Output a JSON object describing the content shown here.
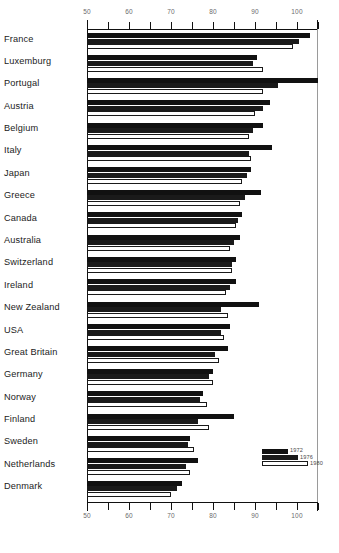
{
  "chart_data": {
    "type": "bar",
    "orientation": "horizontal",
    "title": "",
    "subtitle": "",
    "xlabel": "",
    "ylabel": "",
    "xlim": [
      50,
      105
    ],
    "grid": false,
    "axis_ticks_major": [
      50,
      60,
      70,
      80,
      90,
      100
    ],
    "axis_ticks_minor": [
      55,
      65,
      75,
      85,
      95,
      105
    ],
    "tick_labels": [
      "50",
      "60",
      "70",
      "80",
      "90",
      "100"
    ],
    "legend_position": "bottom-right",
    "categories": [
      "France",
      "Luxemburg",
      "Portugal",
      "Austria",
      "Belgium",
      "Italy",
      "Japan",
      "Greece",
      "Canada",
      "Australia",
      "Switzerland",
      "Ireland",
      "New Zealand",
      "USA",
      "Great Britain",
      "Germany",
      "Norway",
      "Finland",
      "Sweden",
      "Netherlands",
      "Denmark"
    ],
    "series": [
      {
        "name": "1972",
        "pattern": "solid-black",
        "values": [
          103.0,
          90.5,
          105.0,
          93.5,
          92.0,
          94.0,
          89.0,
          91.5,
          87.0,
          86.5,
          85.5,
          85.5,
          91.0,
          84.0,
          83.5,
          80.0,
          77.5,
          85.0,
          74.5,
          76.5,
          72.5
        ]
      },
      {
        "name": "1976",
        "pattern": "stippled",
        "values": [
          100.5,
          89.5,
          95.5,
          92.0,
          89.5,
          88.5,
          88.0,
          87.5,
          86.0,
          85.0,
          84.5,
          84.0,
          82.0,
          82.0,
          80.5,
          79.0,
          77.0,
          76.5,
          74.0,
          73.5,
          71.5
        ]
      },
      {
        "name": "1980",
        "pattern": "white-outline",
        "values": [
          99.0,
          92.0,
          92.0,
          90.0,
          88.5,
          89.0,
          87.0,
          86.5,
          85.5,
          84.0,
          84.5,
          83.0,
          83.5,
          82.5,
          81.5,
          80.0,
          78.5,
          79.0,
          75.5,
          74.5,
          70.0
        ]
      }
    ],
    "legend": [
      {
        "label": "1972",
        "pattern": "solid-black"
      },
      {
        "label": "1976",
        "pattern": "stippled"
      },
      {
        "label": "1980",
        "pattern": "white-outline"
      }
    ],
    "colors": {
      "series_1972": "#111111",
      "series_1976": "#1a1a1a",
      "series_1980": "#ffffff",
      "axis": "#111111",
      "tick_label": "#6b6b6b",
      "category_label": "#1b1b1b",
      "background": "#ffffff"
    }
  }
}
